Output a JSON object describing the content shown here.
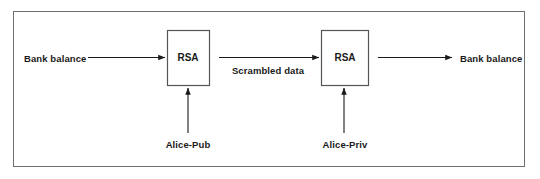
{
  "diagram": {
    "frame": {
      "stroke": "#6e6e6e"
    },
    "line_color": "#1a1a1a",
    "box_stroke": "#555555",
    "text_color": "#1a1a1a",
    "boxes": [
      {
        "id": "rsa-encrypt",
        "label": "RSA",
        "x": 167,
        "y": 30,
        "w": 42,
        "h": 55
      },
      {
        "id": "rsa-decrypt",
        "label": "RSA",
        "x": 321,
        "y": 30,
        "w": 47,
        "h": 55
      }
    ],
    "labels": {
      "input_plaintext": "Bank balance",
      "ciphertext": "Scrambled data",
      "output_plaintext": "Bank balance",
      "key_public": "Alice-Pub",
      "key_private": "Alice-Priv"
    },
    "flow": [
      {
        "from": "input_plaintext",
        "to": "rsa-encrypt",
        "label": ""
      },
      {
        "from": "rsa-encrypt",
        "to": "rsa-decrypt",
        "label": "Scrambled data"
      },
      {
        "from": "rsa-decrypt",
        "to": "output_plaintext",
        "label": ""
      },
      {
        "from": "key_public",
        "to": "rsa-encrypt",
        "label": ""
      },
      {
        "from": "key_private",
        "to": "rsa-decrypt",
        "label": ""
      }
    ]
  }
}
